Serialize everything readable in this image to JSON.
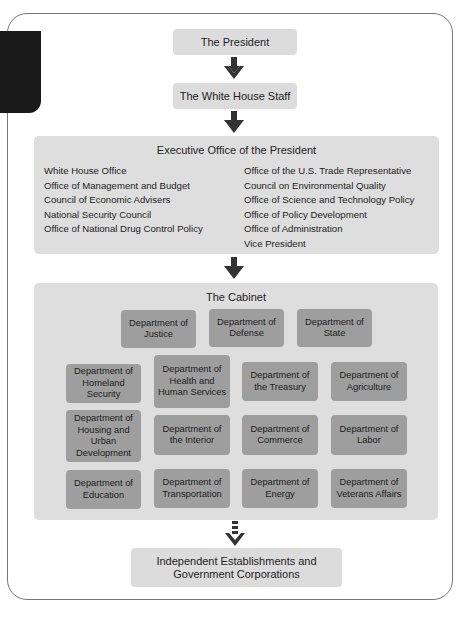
{
  "levels": {
    "president": "The President",
    "white_house_staff": "The White House Staff",
    "independent": "Independent Establishments and Government Corporations"
  },
  "executive_office": {
    "title": "Executive Office of the President",
    "left_column": [
      "White House Office",
      "Office of Management and Budget",
      "Council of Economic Advisers",
      "National Security Council",
      "Office of National Drug Control Policy"
    ],
    "right_column": [
      "Office of the U.S. Trade Representative",
      "Council on Environmental Quality",
      "Office of Science and Technology Policy",
      "Office of Policy Development",
      "Office of Administration",
      "Vice President"
    ]
  },
  "cabinet": {
    "title": "The Cabinet",
    "top_row": [
      "Department of Justice",
      "Department of Defense",
      "Department of State"
    ],
    "grid": [
      [
        "Department of Homeland Security",
        "Department of Health and Human Services",
        "Department of the Treasury",
        "Department of Agriculture"
      ],
      [
        "Department of Housing and Urban Development",
        "Department of the Interior",
        "Department of Commerce",
        "Department of Labor"
      ],
      [
        "Department of Education",
        "Department of Transportation",
        "Department of Energy",
        "Department of Veterans Affairs"
      ]
    ]
  },
  "connectors": [
    {
      "from": "president",
      "to": "white_house_staff",
      "style": "solid-arrow-icon"
    },
    {
      "from": "white_house_staff",
      "to": "executive_office",
      "style": "solid-arrow-icon"
    },
    {
      "from": "executive_office",
      "to": "cabinet",
      "style": "solid-arrow-icon"
    },
    {
      "from": "cabinet",
      "to": "independent",
      "style": "dashed-arrow-icon"
    }
  ],
  "colors": {
    "light_box": "#dcdcdc",
    "department_box": "#9e9e9e",
    "arrow": "#333333",
    "tab": "#1a1a1a"
  }
}
